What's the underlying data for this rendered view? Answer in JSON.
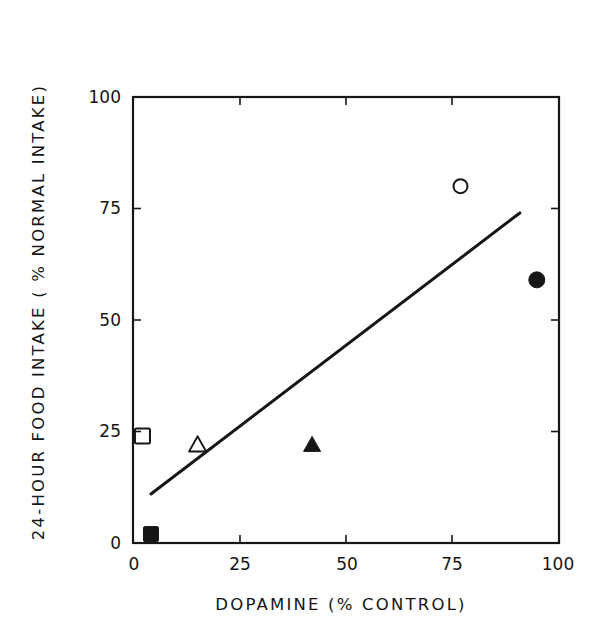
{
  "chart_data": {
    "type": "scatter",
    "title": "",
    "xlabel": "DOPAMINE (% CONTROL)",
    "ylabel": "24-HOUR FOOD INTAKE ( % NORMAL INTAKE)",
    "xlim": [
      0,
      100
    ],
    "ylim": [
      0,
      100
    ],
    "x_ticks": [
      "0",
      "25",
      "50",
      "75",
      "100"
    ],
    "y_ticks": [
      "0",
      "25",
      "50",
      "75",
      "100"
    ],
    "grid": false,
    "legend": null,
    "series": [
      {
        "name": "open-square",
        "marker": "square",
        "filled": false,
        "x": [
          2
        ],
        "y": [
          24
        ]
      },
      {
        "name": "filled-square",
        "marker": "square",
        "filled": true,
        "x": [
          4
        ],
        "y": [
          2
        ]
      },
      {
        "name": "open-triangle",
        "marker": "triangle",
        "filled": false,
        "x": [
          15
        ],
        "y": [
          22
        ]
      },
      {
        "name": "filled-triangle",
        "marker": "triangle",
        "filled": true,
        "x": [
          42
        ],
        "y": [
          22
        ]
      },
      {
        "name": "open-circle",
        "marker": "circle",
        "filled": false,
        "x": [
          77
        ],
        "y": [
          80
        ]
      },
      {
        "name": "filled-circle",
        "marker": "circle",
        "filled": true,
        "x": [
          95
        ],
        "y": [
          59
        ]
      }
    ],
    "regression_line": {
      "x": [
        4,
        91
      ],
      "y": [
        11,
        74
      ]
    }
  },
  "colors": {
    "ink": "#161616",
    "background": "#ffffff"
  }
}
